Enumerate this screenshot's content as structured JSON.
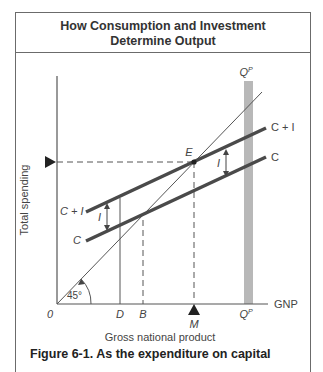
{
  "title": {
    "line1": "How Consumption and Investment",
    "line2": "Determine Output"
  },
  "axes": {
    "y_label": "Total spending",
    "x_label": "Gross national product",
    "x_axis_end_label": "GNP",
    "origin_label": "0"
  },
  "points": {
    "equilibrium": "E",
    "x_ticks": [
      "D",
      "B",
      "M",
      "Q^P"
    ]
  },
  "lines": {
    "c_plus_i": "C + I",
    "c": "C",
    "investment_gap": "I",
    "potential_output": "Q^P",
    "angle": "45°"
  },
  "colors": {
    "thick_line": "#4a4a4a",
    "potential_bar": "#b8b8b8",
    "axis": "#555555"
  },
  "caption": "Figure 6-1. As the expenditure on capital"
}
